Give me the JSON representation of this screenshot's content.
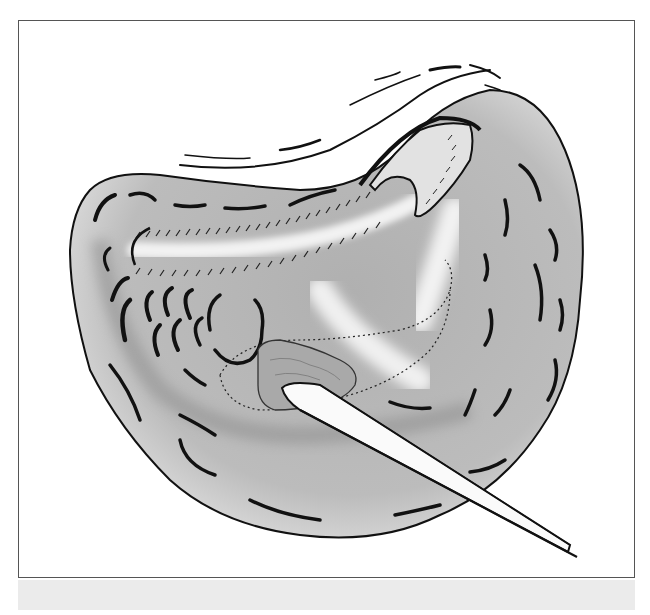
{
  "figure": {
    "style": "grayscale-line-art",
    "elements": [
      "organ-body",
      "inner-cavity",
      "lobulated-tissue",
      "elevated-flap",
      "lesion",
      "dotted-outline",
      "probe-instrument",
      "surrounding-membrane-strokes"
    ],
    "colors": {
      "outline": "#111111",
      "organ_fill": "#b9b9b9",
      "cavity_fill": "#a6a6a6",
      "highlight": "#eeeeee",
      "frame_border": "#555555",
      "bottom_band": "#ebebeb"
    }
  }
}
